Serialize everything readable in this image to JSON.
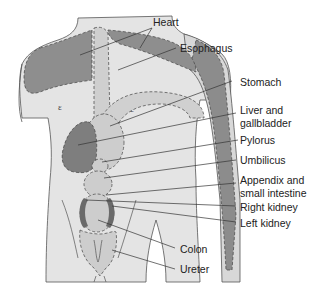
{
  "diagram": {
    "type": "anatomical-referred-pain-map",
    "colors": {
      "skin": "#e6e6e6",
      "organ_light": "#c8c8c8",
      "organ_dark": "#8a8a8a",
      "kidney": "#6e6e6e",
      "outline": "#444444",
      "leader": "#333333"
    },
    "labels": [
      {
        "id": "heart",
        "text": "Heart"
      },
      {
        "id": "esophagus",
        "text": "Esophagus"
      },
      {
        "id": "stomach",
        "text": "Stomach"
      },
      {
        "id": "liver1",
        "text": "Liver and"
      },
      {
        "id": "liver2",
        "text": "gallbladder"
      },
      {
        "id": "pylorus",
        "text": "Pylorus"
      },
      {
        "id": "umbilicus",
        "text": "Umbilicus"
      },
      {
        "id": "appendix1",
        "text": "Appendix and"
      },
      {
        "id": "appendix2",
        "text": "small intestine"
      },
      {
        "id": "rkidney",
        "text": "Right kidney"
      },
      {
        "id": "lkidney",
        "text": "Left kidney"
      },
      {
        "id": "colon",
        "text": "Colon"
      },
      {
        "id": "ureter",
        "text": "Ureter"
      }
    ]
  }
}
